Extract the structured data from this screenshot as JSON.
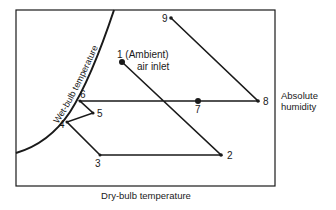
{
  "title": "",
  "axes": {
    "x_label": "Dry-bulb temperature",
    "y_label_line1": "Absolute",
    "y_label_line2": "humidity"
  },
  "curve": {
    "label": "Wet-bulb temperature"
  },
  "points": [
    {
      "id": "1",
      "label": "1 (Ambient)",
      "sublabel": "air inlet",
      "x": 122,
      "y": 62
    },
    {
      "id": "2",
      "label": "2",
      "x": 221,
      "y": 155
    },
    {
      "id": "3",
      "label": "3",
      "x": 100,
      "y": 155
    },
    {
      "id": "4",
      "label": "4",
      "x": 67,
      "y": 122
    },
    {
      "id": "5",
      "label": "5",
      "x": 93,
      "y": 113
    },
    {
      "id": "6",
      "label": "6",
      "x": 80,
      "y": 101
    },
    {
      "id": "7",
      "label": "7",
      "x": 198,
      "y": 101
    },
    {
      "id": "8",
      "label": "8",
      "x": 258,
      "y": 101
    },
    {
      "id": "9",
      "label": "9",
      "x": 171,
      "y": 18
    }
  ],
  "path_order": [
    "1",
    "2",
    "3",
    "4",
    "5",
    "6",
    "7",
    "8",
    "9"
  ],
  "colors": {
    "line": "#1a1a1a",
    "background": "#ffffff"
  }
}
